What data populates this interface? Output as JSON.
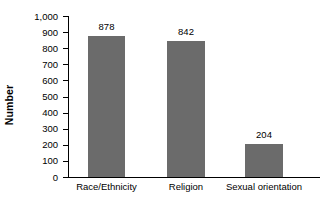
{
  "chart_data": {
    "type": "bar",
    "title": "",
    "subtitle": "",
    "xlabel": "",
    "ylabel": "Number",
    "categories": [
      "Race/Ethnicity",
      "Religion",
      "Sexual orientation"
    ],
    "values": [
      878,
      842,
      204
    ],
    "value_labels": [
      "878",
      "842",
      "204"
    ],
    "ylim": [
      0,
      1000
    ],
    "ytick_values": [
      0,
      100,
      200,
      300,
      400,
      500,
      600,
      700,
      800,
      900,
      1000
    ],
    "ytick_labels": [
      "0",
      "100",
      "200",
      "300",
      "400",
      "500",
      "600",
      "700",
      "800",
      "900",
      "1,000"
    ],
    "grid": false,
    "legend": false,
    "legend_position": "none",
    "bar_color": "#6b6b6b",
    "axis_color": "#000000",
    "background_color": "#ffffff"
  }
}
